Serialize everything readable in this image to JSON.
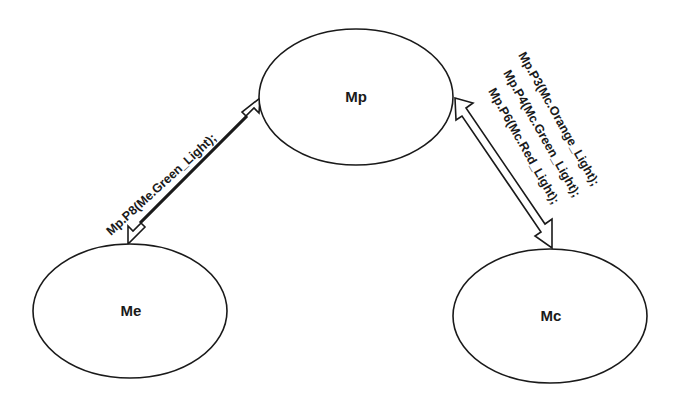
{
  "diagram": {
    "nodes": [
      {
        "id": "Mp",
        "label": "Mp"
      },
      {
        "id": "Me",
        "label": "Me"
      },
      {
        "id": "Mc",
        "label": "Mc"
      }
    ],
    "edges": [
      {
        "from": "Me",
        "to": "Mp",
        "direction": "bidirectional",
        "labels": [
          "Mp.P8(Me.Green_Light);"
        ]
      },
      {
        "from": "Mp",
        "to": "Mc",
        "direction": "bidirectional",
        "labels": [
          "Mp.P3(Mc.Orange_Light);",
          "Mp.P4(Mc.Green_Light);",
          "Mp.P6(Mc.Red_Light);"
        ]
      }
    ]
  }
}
